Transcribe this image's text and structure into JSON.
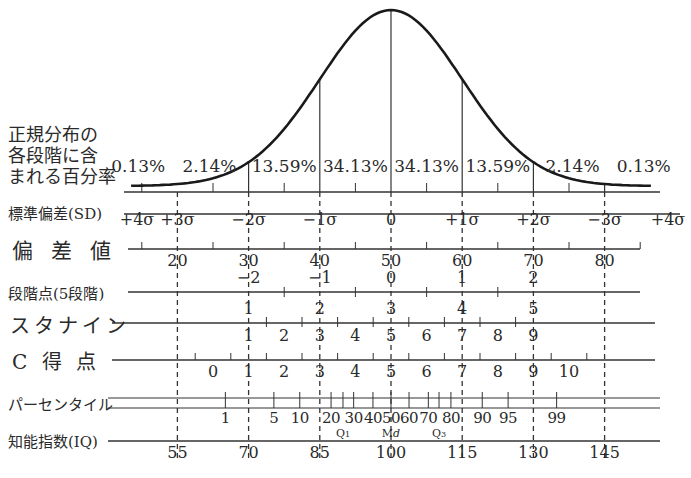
{
  "chart_data": {
    "type": "diagram",
    "curve": "normal distribution (bell curve), mean at 0σ",
    "geometry": {
      "mean_x": 391,
      "sigma_px": 71.2
    },
    "percent_label": "正規分布の各段階に含まれる百分率",
    "percent_label_lines": [
      "正規分布の",
      "各段階に含",
      "まれる百分率"
    ],
    "percentages": [
      {
        "text": "0.13%",
        "z": -3.55
      },
      {
        "text": "2.14%",
        "z": -2.55
      },
      {
        "text": "13.59%",
        "z": -1.5
      },
      {
        "text": "34.13%",
        "z": -0.5
      },
      {
        "text": "34.13%",
        "z": 0.5
      },
      {
        "text": "13.59%",
        "z": 1.5
      },
      {
        "text": "2.14%",
        "z": 2.55
      },
      {
        "text": "0.13%",
        "z": 3.55
      }
    ],
    "rows": {
      "sd": {
        "label": "標準偏差(SD)",
        "ticks": [
          {
            "text": "+4σ",
            "z": -4
          },
          {
            "text": "+3σ",
            "z": -3
          },
          {
            "text": "−2σ",
            "z": -2
          },
          {
            "text": "−1σ",
            "z": -1
          },
          {
            "text": "0",
            "z": 0
          },
          {
            "text": "+1σ",
            "z": 1
          },
          {
            "text": "+2σ",
            "z": 2
          },
          {
            "text": "−3σ",
            "z": 3
          },
          {
            "text": "+4σ",
            "z": 4
          }
        ]
      },
      "deviation_score": {
        "label": "偏差値",
        "labels": [
          {
            "text": "20",
            "z": -3
          },
          {
            "text": "30",
            "z": -2
          },
          {
            "text": "40",
            "z": -1
          },
          {
            "text": "50",
            "z": 0
          },
          {
            "text": "60",
            "z": 1
          },
          {
            "text": "70",
            "z": 2
          },
          {
            "text": "80",
            "z": 3
          }
        ],
        "minor_ticks_z": [
          -3.5,
          -2.5,
          -1.5,
          -0.5,
          0.5,
          1.5,
          2.5,
          3.5
        ]
      },
      "five_level": {
        "label": "段階点(5段階)",
        "labels": [
          {
            "text": "−2",
            "z": -2
          },
          {
            "text": "−1",
            "z": -1
          },
          {
            "text": "0",
            "z": 0
          },
          {
            "text": "1",
            "z": 1
          },
          {
            "text": "2",
            "z": 2
          }
        ],
        "boundaries_z": [
          -1.5,
          -0.5,
          0.5,
          1.5
        ]
      },
      "stanine": {
        "label": "スタナイン",
        "top_labels": [
          {
            "text": "1",
            "z": -2
          },
          {
            "text": "2",
            "z": -1
          },
          {
            "text": "3",
            "z": 0
          },
          {
            "text": "4",
            "z": 1
          },
          {
            "text": "5",
            "z": 2
          }
        ],
        "bottom_labels": [
          {
            "text": "1",
            "z": -2
          },
          {
            "text": "2",
            "z": -1.5
          },
          {
            "text": "3",
            "z": -1
          },
          {
            "text": "4",
            "z": -0.5
          },
          {
            "text": "5",
            "z": 0
          },
          {
            "text": "6",
            "z": 0.5
          },
          {
            "text": "7",
            "z": 1
          },
          {
            "text": "8",
            "z": 1.5
          },
          {
            "text": "9",
            "z": 2
          }
        ],
        "boundaries_z": [
          -1.75,
          -1.25,
          -0.75,
          -0.25,
          0.25,
          0.75,
          1.25,
          1.75
        ]
      },
      "c_score": {
        "label": "C 得 点",
        "labels": [
          {
            "text": "0",
            "z": -2.5
          },
          {
            "text": "1",
            "z": -2
          },
          {
            "text": "2",
            "z": -1.5
          },
          {
            "text": "3",
            "z": -1
          },
          {
            "text": "4",
            "z": -0.5
          },
          {
            "text": "5",
            "z": 0
          },
          {
            "text": "6",
            "z": 0.5
          },
          {
            "text": "7",
            "z": 1
          },
          {
            "text": "8",
            "z": 1.5
          },
          {
            "text": "9",
            "z": 2
          },
          {
            "text": "10",
            "z": 2.5
          }
        ],
        "boundaries_z": [
          -2.75,
          -2.25,
          -1.75,
          -1.25,
          -0.75,
          -0.25,
          0.25,
          0.75,
          1.25,
          1.75,
          2.25,
          2.75
        ]
      },
      "percentile": {
        "label": "パーセンタイル",
        "labels": [
          {
            "text": "1",
            "p": 1
          },
          {
            "text": "5",
            "p": 5
          },
          {
            "text": "10",
            "p": 10
          },
          {
            "text": "20",
            "p": 20
          },
          {
            "text": "30",
            "p": 30
          },
          {
            "text": "40",
            "p": 40
          },
          {
            "text": "50",
            "p": 50
          },
          {
            "text": "60",
            "p": 60
          },
          {
            "text": "70",
            "p": 70
          },
          {
            "text": "80",
            "p": 80
          },
          {
            "text": "90",
            "p": 90
          },
          {
            "text": "95",
            "p": 95
          },
          {
            "text": "99",
            "p": 99
          }
        ],
        "tick_percentiles": [
          1,
          5,
          10,
          20,
          25,
          30,
          40,
          50,
          60,
          70,
          75,
          80,
          90,
          95,
          99
        ],
        "quartile_labels": [
          {
            "text": "Q",
            "sub": "1",
            "p": 25
          },
          {
            "text": "M",
            "sub": "d",
            "p": 50
          },
          {
            "text": "Q",
            "sub": "3",
            "p": 75
          }
        ]
      },
      "iq": {
        "label": "知能指数(IQ)",
        "labels": [
          {
            "text": "55",
            "z": -3
          },
          {
            "text": "70",
            "z": -2
          },
          {
            "text": "85",
            "z": -1
          },
          {
            "text": "100",
            "z": 0
          },
          {
            "text": "115",
            "z": 1
          },
          {
            "text": "130",
            "z": 2
          },
          {
            "text": "145",
            "z": 3
          }
        ]
      }
    }
  }
}
